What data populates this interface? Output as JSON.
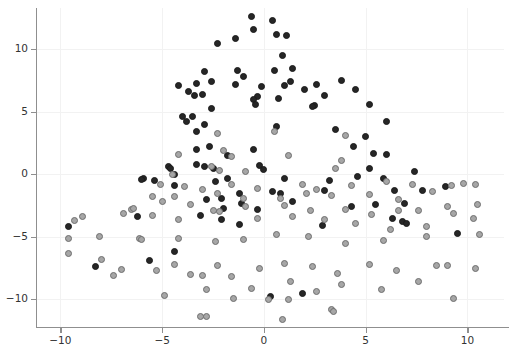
{
  "chart_data": {
    "type": "scatter",
    "title": "",
    "subtitle": "",
    "xlabel": "",
    "ylabel": "",
    "xlim": [
      -11.2,
      11.8
    ],
    "ylim": [
      -12.3,
      13.3
    ],
    "xticks": [
      -10,
      -5,
      0,
      5,
      10
    ],
    "xticklabels": [
      "−10",
      "−5",
      "0",
      "5",
      "10"
    ],
    "yticks": [
      10,
      5,
      0,
      -5,
      -10
    ],
    "yticklabels": [
      "10",
      "5",
      "0",
      "−5",
      "−10"
    ],
    "grid": true,
    "grid_color": "#f2f2f2",
    "legend": null,
    "annotations": [],
    "series": [
      {
        "name": "class-dark",
        "marker": "circle",
        "color": "#262626",
        "edge_color": "#1a1a1a",
        "size": 7,
        "points": [
          [
            -0.6,
            12.6
          ],
          [
            -0.5,
            11.6
          ],
          [
            -1.4,
            10.9
          ],
          [
            0.6,
            11.2
          ],
          [
            -2.3,
            10.5
          ],
          [
            0.4,
            12.3
          ],
          [
            1.1,
            11.1
          ],
          [
            0.9,
            9.5
          ],
          [
            -2.9,
            8.2
          ],
          [
            -1.3,
            8.3
          ],
          [
            0.5,
            8.3
          ],
          [
            1.4,
            8.5
          ],
          [
            -1.0,
            7.8
          ],
          [
            -1.4,
            7.2
          ],
          [
            -0.1,
            7.0
          ],
          [
            1.0,
            7.1
          ],
          [
            1.3,
            7.4
          ],
          [
            -4.2,
            7.1
          ],
          [
            -3.3,
            7.3
          ],
          [
            -2.6,
            7.4
          ],
          [
            -3.4,
            6.3
          ],
          [
            -3.0,
            6.4
          ],
          [
            -3.7,
            6.6
          ],
          [
            -0.3,
            6.2
          ],
          [
            -0.5,
            6.0
          ],
          [
            -0.4,
            5.6
          ],
          [
            0.7,
            6.1
          ],
          [
            2.6,
            7.2
          ],
          [
            2.0,
            6.8
          ],
          [
            3.8,
            7.5
          ],
          [
            3.0,
            6.3
          ],
          [
            4.5,
            6.8
          ],
          [
            2.5,
            5.5
          ],
          [
            2.4,
            5.4
          ],
          [
            5.2,
            5.6
          ],
          [
            -2.6,
            5.3
          ],
          [
            -4.0,
            4.6
          ],
          [
            -3.5,
            4.6
          ],
          [
            -3.8,
            4.2
          ],
          [
            -2.9,
            4.0
          ],
          [
            -3.3,
            3.4
          ],
          [
            6.0,
            4.2
          ],
          [
            0.6,
            3.8
          ],
          [
            3.5,
            3.6
          ],
          [
            5.0,
            3.0
          ],
          [
            -3.3,
            2.0
          ],
          [
            -2.7,
            2.2
          ],
          [
            -0.5,
            2.0
          ],
          [
            4.4,
            2.2
          ],
          [
            5.4,
            1.7
          ],
          [
            6.0,
            1.6
          ],
          [
            -3.3,
            0.8
          ],
          [
            -2.9,
            0.6
          ],
          [
            -4.7,
            0.6
          ],
          [
            -4.6,
            0.5
          ],
          [
            -4.4,
            0.0
          ],
          [
            -2.5,
            0.5
          ],
          [
            -1.8,
            1.5
          ],
          [
            -0.2,
            0.7
          ],
          [
            0.0,
            0.4
          ],
          [
            5.2,
            0.5
          ],
          [
            4.6,
            -0.2
          ],
          [
            5.9,
            -0.3
          ],
          [
            7.4,
            0.2
          ],
          [
            -1.8,
            -0.3
          ],
          [
            -2.4,
            -0.6
          ],
          [
            -4.4,
            -0.9
          ],
          [
            -5.4,
            -0.5
          ],
          [
            -5.9,
            -0.3
          ],
          [
            -6.0,
            -0.4
          ],
          [
            1.0,
            -0.3
          ],
          [
            3.2,
            -0.5
          ],
          [
            -1.2,
            -1.5
          ],
          [
            0.4,
            -1.4
          ],
          [
            0.8,
            -1.5
          ],
          [
            3.0,
            -1.3
          ],
          [
            -2.8,
            -2.0
          ],
          [
            -2.1,
            -1.9
          ],
          [
            6.4,
            -1.3
          ],
          [
            8.9,
            -1.0
          ],
          [
            -1.1,
            -2.3
          ],
          [
            1.4,
            -2.2
          ],
          [
            -0.3,
            -2.8
          ],
          [
            7.8,
            -1.3
          ],
          [
            5.5,
            -2.4
          ],
          [
            6.9,
            -2.3
          ],
          [
            -3.1,
            -3.3
          ],
          [
            -2.0,
            -2.7
          ],
          [
            -2.1,
            -3.6
          ],
          [
            -6.2,
            -3.4
          ],
          [
            -9.6,
            -4.2
          ],
          [
            -8.3,
            -7.4
          ],
          [
            -5.6,
            -6.9
          ],
          [
            -1.2,
            -4.0
          ],
          [
            -4.4,
            -6.2
          ],
          [
            6.3,
            -3.5
          ],
          [
            6.8,
            -3.8
          ],
          [
            7.0,
            -3.9
          ],
          [
            2.9,
            -4.1
          ],
          [
            9.5,
            -4.7
          ],
          [
            4.3,
            -2.6
          ],
          [
            0.3,
            -9.8
          ],
          [
            1.9,
            -9.5
          ]
        ]
      },
      {
        "name": "class-light",
        "marker": "circle",
        "color": "#a6a6a6",
        "edge_color": "#6e6e6e",
        "size": 7,
        "points": [
          [
            -2.3,
            3.3
          ],
          [
            0.5,
            3.4
          ],
          [
            4.0,
            3.1
          ],
          [
            -2.0,
            1.9
          ],
          [
            -4.2,
            1.6
          ],
          [
            -1.6,
            1.4
          ],
          [
            1.2,
            1.5
          ],
          [
            -2.6,
            0.6
          ],
          [
            -4.5,
            0.0
          ],
          [
            -2.2,
            0.3
          ],
          [
            -0.9,
            0.2
          ],
          [
            3.8,
            1.1
          ],
          [
            3.5,
            0.5
          ],
          [
            -3.9,
            -1.0
          ],
          [
            -5.1,
            -0.8
          ],
          [
            -3.0,
            -1.2
          ],
          [
            -1.6,
            -0.8
          ],
          [
            -0.3,
            -1.1
          ],
          [
            1.9,
            -0.8
          ],
          [
            2.6,
            -1.2
          ],
          [
            4.3,
            -0.9
          ],
          [
            6.0,
            -0.6
          ],
          [
            7.3,
            -0.8
          ],
          [
            9.2,
            -0.9
          ],
          [
            9.8,
            -0.7
          ],
          [
            10.4,
            -0.8
          ],
          [
            -5.5,
            -1.8
          ],
          [
            -4.4,
            -1.8
          ],
          [
            -2.3,
            -1.5
          ],
          [
            -1.0,
            -1.9
          ],
          [
            0.8,
            -1.9
          ],
          [
            2.1,
            -1.5
          ],
          [
            3.3,
            -1.7
          ],
          [
            5.2,
            -1.6
          ],
          [
            6.6,
            -2.0
          ],
          [
            8.3,
            -1.4
          ],
          [
            9.0,
            -2.6
          ],
          [
            10.5,
            -2.4
          ],
          [
            -6.5,
            -2.8
          ],
          [
            -5.0,
            -2.2
          ],
          [
            -3.6,
            -2.4
          ],
          [
            -2.5,
            -2.9
          ],
          [
            -0.9,
            -2.6
          ],
          [
            1.0,
            -2.5
          ],
          [
            2.3,
            -2.9
          ],
          [
            4.0,
            -2.8
          ],
          [
            5.3,
            -3.2
          ],
          [
            6.6,
            -2.9
          ],
          [
            7.6,
            -2.9
          ],
          [
            9.3,
            -3.1
          ],
          [
            -8.9,
            -3.4
          ],
          [
            -9.3,
            -3.7
          ],
          [
            -6.9,
            -3.1
          ],
          [
            -5.5,
            -3.3
          ],
          [
            -4.2,
            -3.6
          ],
          [
            -2.2,
            -3.0
          ],
          [
            -0.3,
            -3.5
          ],
          [
            1.4,
            -3.4
          ],
          [
            3.0,
            -3.6
          ],
          [
            4.5,
            -3.9
          ],
          [
            6.2,
            -4.4
          ],
          [
            8.0,
            -4.2
          ],
          [
            10.3,
            -3.5
          ],
          [
            -9.6,
            -5.1
          ],
          [
            -9.6,
            -6.3
          ],
          [
            -6.1,
            -5.1
          ],
          [
            -6.0,
            -5.2
          ],
          [
            -4.2,
            -5.1
          ],
          [
            -2.4,
            -5.4
          ],
          [
            -1.0,
            -5.2
          ],
          [
            0.6,
            -4.8
          ],
          [
            2.2,
            -5.0
          ],
          [
            4.0,
            -5.5
          ],
          [
            5.9,
            -5.3
          ],
          [
            8.0,
            -5.0
          ],
          [
            10.6,
            -4.8
          ],
          [
            -8.0,
            -6.8
          ],
          [
            -7.0,
            -7.6
          ],
          [
            -7.4,
            -8.1
          ],
          [
            -5.3,
            -7.7
          ],
          [
            -4.4,
            -7.2
          ],
          [
            -3.6,
            -8.0
          ],
          [
            -3.0,
            -8.1
          ],
          [
            -2.3,
            -7.3
          ],
          [
            -1.6,
            -8.2
          ],
          [
            -0.2,
            -7.5
          ],
          [
            1.0,
            -7.1
          ],
          [
            2.4,
            -7.4
          ],
          [
            3.6,
            -7.9
          ],
          [
            5.2,
            -7.2
          ],
          [
            6.5,
            -7.7
          ],
          [
            8.5,
            -7.3
          ],
          [
            9.0,
            -7.3
          ],
          [
            10.4,
            -7.5
          ],
          [
            -2.8,
            -9.2
          ],
          [
            -1.5,
            -9.9
          ],
          [
            -0.6,
            -9.1
          ],
          [
            0.2,
            -10.0
          ],
          [
            1.3,
            -8.6
          ],
          [
            2.6,
            -9.4
          ],
          [
            3.8,
            -8.8
          ],
          [
            5.8,
            -9.2
          ],
          [
            7.6,
            -8.6
          ],
          [
            9.3,
            -9.9
          ],
          [
            -3.1,
            -11.4
          ],
          [
            -2.8,
            -11.4
          ],
          [
            1.2,
            -10.0
          ],
          [
            3.3,
            -10.8
          ],
          [
            3.4,
            -11.0
          ],
          [
            -4.9,
            -9.7
          ],
          [
            -6.4,
            -2.7
          ],
          [
            -8.1,
            -5.0
          ],
          [
            0.9,
            -11.6
          ]
        ]
      }
    ]
  }
}
